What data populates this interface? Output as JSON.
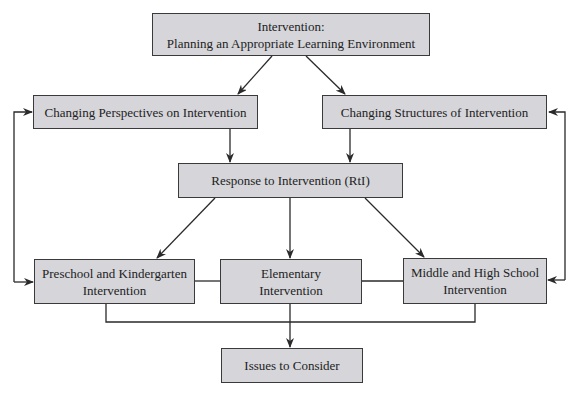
{
  "diagram": {
    "type": "flowchart",
    "colors": {
      "box_fill": "#d5d5da",
      "border": "#3a3a3a",
      "text": "#222222"
    },
    "nodes": {
      "top": {
        "line1": "Intervention:",
        "line2": "Planning an Appropriate Learning Environment"
      },
      "perspectives": {
        "label": "Changing Perspectives on Intervention"
      },
      "structures": {
        "label": "Changing Structures of Intervention"
      },
      "rti": {
        "label": "Response to Intervention (RtI)"
      },
      "preschool": {
        "line1": "Preschool and Kindergarten",
        "line2": "Intervention"
      },
      "elementary": {
        "line1": "Elementary",
        "line2": "Intervention"
      },
      "middle_high": {
        "line1": "Middle and High School",
        "line2": "Intervention"
      },
      "issues": {
        "label": "Issues to Consider"
      }
    },
    "edges": [
      {
        "from": "top",
        "to": "perspectives"
      },
      {
        "from": "top",
        "to": "structures"
      },
      {
        "from": "perspectives",
        "to": "rti"
      },
      {
        "from": "structures",
        "to": "rti"
      },
      {
        "from": "rti",
        "to": "preschool"
      },
      {
        "from": "rti",
        "to": "elementary"
      },
      {
        "from": "rti",
        "to": "middle_high"
      },
      {
        "from": "preschool",
        "to": "perspectives",
        "note": "feedback loop left"
      },
      {
        "from": "perspectives",
        "to": "preschool",
        "note": "feedback loop left"
      },
      {
        "from": "middle_high",
        "to": "structures",
        "note": "feedback loop right"
      },
      {
        "from": "structures",
        "to": "middle_high",
        "note": "feedback loop right"
      },
      {
        "from": "preschool",
        "to": "elementary",
        "note": "connector line"
      },
      {
        "from": "elementary",
        "to": "middle_high",
        "note": "connector line"
      },
      {
        "from": "preschool",
        "to": "issues"
      },
      {
        "from": "elementary",
        "to": "issues"
      },
      {
        "from": "middle_high",
        "to": "issues"
      }
    ]
  }
}
